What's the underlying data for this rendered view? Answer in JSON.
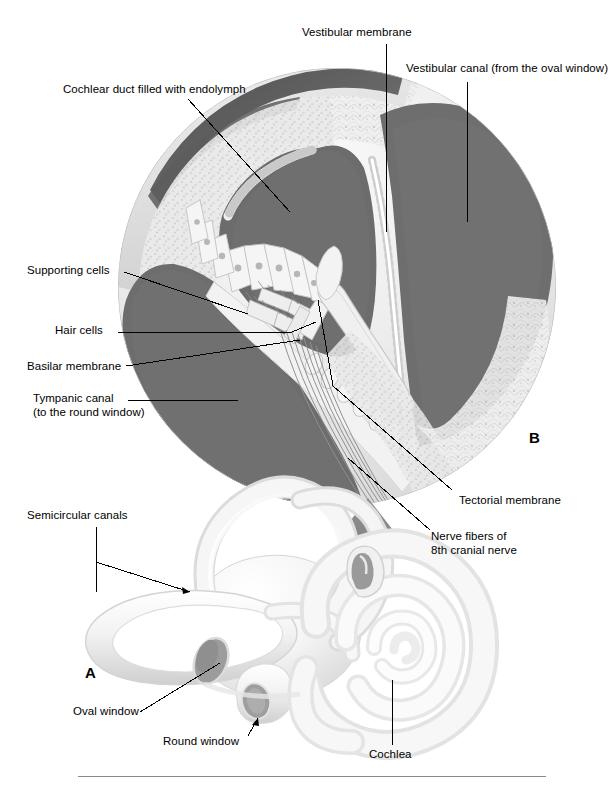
{
  "figure": {
    "panels": [
      {
        "id": "A",
        "letter": "A",
        "caption": "Inner ear bony labyrinth"
      },
      {
        "id": "B",
        "letter": "B",
        "caption": "Cross-section through one turn of the cochlea"
      }
    ]
  },
  "labels": {
    "vestibular_membrane": "Vestibular membrane",
    "vestibular_canal": "Vestibular canal (from the oval window)",
    "cochlear_duct": "Cochlear duct filled with endolymph",
    "supporting_cells": "Supporting cells",
    "hair_cells": "Hair cells",
    "basilar_membrane": "Basilar membrane",
    "tympanic_canal_line1": "Tympanic canal",
    "tympanic_canal_line2": "(to the round window)",
    "tectorial_membrane": "Tectorial membrane",
    "nerve_fibers_line1": "Nerve fibers of",
    "nerve_fibers_line2": "8th cranial nerve",
    "semicircular_canals": "Semicircular canals",
    "oval_window": "Oval window",
    "round_window": "Round window",
    "cochlea": "Cochlea",
    "panel_a_letter": "A",
    "panel_b_letter": "B"
  },
  "colors": {
    "background": "#ffffff",
    "ink": "#000000",
    "fluid_dark_gray": "#6e6e6e",
    "fluid_darker_gray": "#5f5f5f",
    "bone_light": "#f2f2f2",
    "bone_shadow": "#d8d8d8",
    "tissue_mid": "#c9c9c9",
    "arrow_gray": "#848484",
    "window_gray": "#9a9a9a",
    "rule_gray": "#8a8a8a",
    "capsule_crest": "#dadada"
  }
}
